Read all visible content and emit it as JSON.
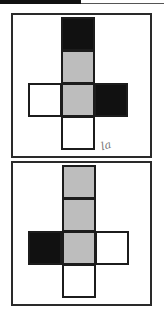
{
  "header": {
    "bar_color": "#111111"
  },
  "colors": {
    "black": "#111111",
    "gray": "#bdbdbd",
    "white": "#ffffff",
    "stroke": "#1c1c1c"
  },
  "panels": [
    {
      "id": "net-1",
      "squares": [
        {
          "row": 0,
          "col": 1,
          "fill": "black"
        },
        {
          "row": 1,
          "col": 1,
          "fill": "gray"
        },
        {
          "row": 2,
          "col": 0,
          "fill": "white"
        },
        {
          "row": 2,
          "col": 1,
          "fill": "gray"
        },
        {
          "row": 2,
          "col": 2,
          "fill": "black"
        },
        {
          "row": 3,
          "col": 1,
          "fill": "white"
        }
      ],
      "annotation": "la"
    },
    {
      "id": "net-2",
      "squares": [
        {
          "row": 0,
          "col": 1,
          "fill": "gray"
        },
        {
          "row": 1,
          "col": 1,
          "fill": "gray"
        },
        {
          "row": 2,
          "col": 0,
          "fill": "black"
        },
        {
          "row": 2,
          "col": 1,
          "fill": "gray"
        },
        {
          "row": 2,
          "col": 2,
          "fill": "white"
        },
        {
          "row": 3,
          "col": 1,
          "fill": "white"
        }
      ]
    }
  ]
}
